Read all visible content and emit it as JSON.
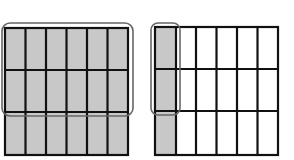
{
  "diagram": {
    "colors": {
      "shaded": "#c8c8c8",
      "unshaded": "#ffffff",
      "grid_line": "#111111",
      "highlight_outline": "#666666"
    },
    "left_model": {
      "rows": 3,
      "cols": 6,
      "shaded_cells": "all",
      "highlight": "top 2 rows circled"
    },
    "right_model": {
      "rows": 3,
      "cols": 6,
      "shaded_cells": "first column",
      "highlight": "first column, top 2 rows circled"
    }
  }
}
